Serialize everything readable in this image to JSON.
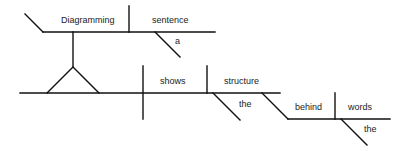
{
  "diagram": {
    "type": "sentence-diagram",
    "sentence": "Diagramming a sentence shows the structure behind the words",
    "subject_clause": {
      "verb_gerund": "Diagramming",
      "object": "sentence",
      "object_modifier": "a"
    },
    "main_clause": {
      "verb": "shows",
      "direct_object": "structure",
      "object_modifier": "the",
      "preposition": "behind",
      "prepositional_object": "words",
      "prepositional_object_modifier": "the"
    },
    "colors": {
      "line": "#111111",
      "text": "#222222",
      "background": "#ffffff"
    }
  }
}
